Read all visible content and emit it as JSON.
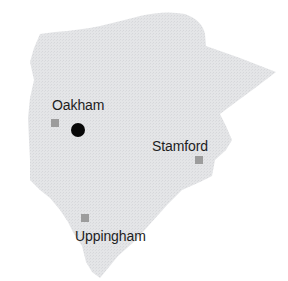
{
  "map": {
    "region_fill": "#e4e5e7",
    "region_texture": "#d6d7da",
    "marker_color": "#9c9c9c",
    "county_town_color": "#080808",
    "label_color": "#1e1e1e"
  },
  "towns": [
    {
      "name": "Oakham",
      "marker": "square",
      "county_town": true
    },
    {
      "name": "Stamford",
      "marker": "square",
      "county_town": false
    },
    {
      "name": "Uppingham",
      "marker": "square",
      "county_town": false
    }
  ]
}
